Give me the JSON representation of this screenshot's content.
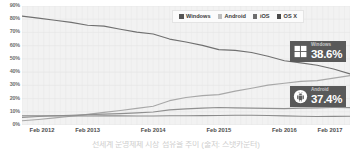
{
  "chart_data": {
    "type": "line",
    "title": "",
    "subtitle": "",
    "xlabel": "",
    "ylabel": "",
    "grid": true,
    "legend_position": "top-right",
    "ylim": [
      0,
      90
    ],
    "y_ticks": [
      "0%",
      "10%",
      "20%",
      "30%",
      "40%",
      "50%",
      "60%",
      "70%",
      "80%",
      "90%"
    ],
    "y_tick_values": [
      0,
      10,
      20,
      30,
      40,
      50,
      60,
      70,
      80,
      90
    ],
    "x_ticks": [
      "Feb 2012",
      "Feb 2013",
      "Feb 2014",
      "Feb 2015",
      "Feb 2016",
      "Feb 2017"
    ],
    "x_tick_values": [
      2012.08,
      2013.08,
      2014.08,
      2015.08,
      2016.08,
      2017.08
    ],
    "x": [
      2012.08,
      2012.33,
      2012.58,
      2012.83,
      2013.08,
      2013.33,
      2013.58,
      2013.83,
      2014.08,
      2014.33,
      2014.58,
      2014.83,
      2015.08,
      2015.33,
      2015.58,
      2015.83,
      2016.08,
      2016.33,
      2016.58,
      2016.83,
      2017.08
    ],
    "series": [
      {
        "name": "Windows",
        "color": "#707070",
        "values": [
          82.4,
          80.8,
          79.2,
          77.6,
          75.4,
          74.8,
          72.4,
          70.2,
          68.8,
          65.0,
          62.8,
          60.2,
          57.0,
          56.4,
          54.8,
          52.0,
          48.6,
          47.0,
          45.2,
          42.4,
          38.6
        ]
      },
      {
        "name": "Android",
        "color": "#a8a8a8",
        "values": [
          3.2,
          4.2,
          5.4,
          6.6,
          8.0,
          9.6,
          11.0,
          12.6,
          14.2,
          18.4,
          20.8,
          22.2,
          23.0,
          25.6,
          27.8,
          30.2,
          31.6,
          33.0,
          33.6,
          35.4,
          37.4
        ]
      },
      {
        "name": "iOS",
        "color": "#909090",
        "values": [
          5.8,
          6.4,
          7.0,
          7.4,
          7.8,
          8.2,
          8.6,
          9.2,
          9.8,
          11.4,
          12.2,
          12.8,
          13.2,
          13.0,
          12.8,
          12.6,
          12.4,
          12.8,
          13.0,
          13.2,
          13.2
        ]
      },
      {
        "name": "OS X",
        "color": "#8b8b8b",
        "values": [
          7.0,
          7.0,
          6.9,
          6.9,
          6.8,
          6.9,
          6.9,
          6.8,
          6.8,
          7.0,
          7.0,
          7.1,
          7.2,
          7.4,
          7.4,
          7.2,
          6.9,
          6.6,
          6.4,
          6.5,
          6.6
        ]
      }
    ],
    "annotations": [
      {
        "series": "Windows",
        "label": "Windows",
        "value": "38.6%"
      },
      {
        "series": "Android",
        "label": "Android",
        "value": "37.4%"
      }
    ]
  },
  "legend": {
    "items": [
      {
        "label": "Windows",
        "color": "#555555"
      },
      {
        "label": "Android",
        "color": "#bdbdbd"
      },
      {
        "label": "iOS",
        "color": "#6e6e6e"
      },
      {
        "label": "OS X",
        "color": "#4a4a4a"
      }
    ]
  },
  "callouts": {
    "windows": {
      "name": "Windows",
      "value": "38.6%",
      "icon": "windows-logo-icon",
      "background": "#595959"
    },
    "android": {
      "name": "Android",
      "value": "37.4%",
      "icon": "android-robot-icon",
      "background": "#5e5e5e"
    }
  },
  "caption": {
    "text": "전세계 운영체제 시장 점유율 추이 (출처: 스탯카운터)"
  },
  "plot": {
    "background": "#f2f2f2",
    "gridline_color": "#e6e6e6"
  }
}
